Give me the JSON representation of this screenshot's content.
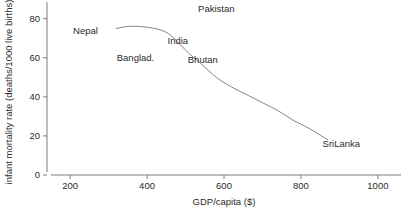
{
  "chart_data": {
    "type": "line",
    "title": "",
    "xlabel": "GDP/capita ($)",
    "ylabel": "infant mortality rate (deaths/1000 live births)",
    "xlim": [
      140,
      1060
    ],
    "ylim": [
      0,
      87
    ],
    "grid": false,
    "legend": "none",
    "xticks": [
      200,
      400,
      600,
      800,
      1000
    ],
    "xtick_labels": [
      "200",
      "400",
      "600",
      "800",
      "1000"
    ],
    "yticks": [
      0,
      20,
      40,
      60,
      80
    ],
    "ytick_labels": [
      "0",
      "20",
      "40",
      "60",
      "80"
    ],
    "series": [
      {
        "name": "South Asia infant mortality vs GDP",
        "x": [
          320,
          350,
          380,
          420,
          450,
          470,
          490,
          510,
          540,
          580,
          620,
          660,
          700,
          740,
          780,
          820,
          870
        ],
        "y": [
          75,
          76,
          76,
          75,
          73,
          70,
          66,
          62,
          57,
          50,
          45,
          41,
          37,
          33,
          28,
          24,
          18
        ]
      }
    ],
    "annotations": [
      {
        "label": "Nepal",
        "x": 240,
        "y": 74
      },
      {
        "label": "Banglad.",
        "x": 370,
        "y": 60
      },
      {
        "label": "Pakistan",
        "x": 580,
        "y": 85
      },
      {
        "label": "India",
        "x": 480,
        "y": 69
      },
      {
        "label": "Bhutan",
        "x": 545,
        "y": 59
      },
      {
        "label": "SriLanka",
        "x": 905,
        "y": 16
      }
    ]
  },
  "colors": {
    "line": "#767676",
    "axis": "#6e6e6e",
    "text": "#2b2b2b",
    "background": "#ffffff"
  }
}
